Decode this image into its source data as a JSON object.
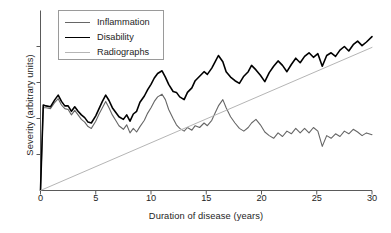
{
  "chart_data": {
    "type": "line",
    "title": "",
    "xlabel": "Duration of disease (years)",
    "ylabel": "Severity (arbitrary units)",
    "xlim": [
      0,
      30
    ],
    "ylim": [
      0,
      10
    ],
    "xticks": [
      0,
      5,
      10,
      15,
      20,
      25,
      30
    ],
    "xtick_labels": [
      "0",
      "5",
      "10",
      "15",
      "20",
      "25",
      "30"
    ],
    "ytick_labels": [],
    "yticks_unlabeled_count": 4,
    "grid": false,
    "legend_position": "upper left",
    "legend_boxed": true,
    "series": [
      {
        "name": "Inflammation",
        "color": "#666666",
        "width": 1.1,
        "x": [
          0,
          0.25,
          0.5,
          0.9,
          1.3,
          1.6,
          1.9,
          2.2,
          2.5,
          2.8,
          3.1,
          3.4,
          3.7,
          4.0,
          4.3,
          4.6,
          5.0,
          5.3,
          5.6,
          5.9,
          6.2,
          6.5,
          6.8,
          7.1,
          7.5,
          7.8,
          8.1,
          8.4,
          8.7,
          9.0,
          9.4,
          9.7,
          10.0,
          10.3,
          10.6,
          11.0,
          11.3,
          11.6,
          12.0,
          12.3,
          12.6,
          13.0,
          13.3,
          13.7,
          14.0,
          14.4,
          14.8,
          15.1,
          15.5,
          15.8,
          16.1,
          16.5,
          16.8,
          17.2,
          17.6,
          18.0,
          18.4,
          18.8,
          19.1,
          19.5,
          19.9,
          20.3,
          20.7,
          21.1,
          21.5,
          21.9,
          22.3,
          22.7,
          23.1,
          23.5,
          23.9,
          24.3,
          24.7,
          25.1,
          25.5,
          25.9,
          26.3,
          26.7,
          27.1,
          27.5,
          27.9,
          28.3,
          28.7,
          29.1,
          29.5,
          30.0
        ],
        "y": [
          0,
          4.6,
          4.6,
          4.55,
          4.9,
          5.1,
          4.75,
          4.55,
          4.5,
          4.2,
          4.45,
          4.2,
          3.95,
          3.8,
          3.55,
          3.45,
          3.85,
          4.25,
          4.6,
          4.95,
          4.6,
          4.2,
          3.9,
          3.6,
          3.4,
          3.65,
          3.2,
          3.45,
          3.25,
          3.55,
          3.9,
          4.3,
          4.6,
          4.95,
          5.2,
          5.35,
          5.05,
          4.5,
          4.0,
          3.65,
          3.45,
          3.3,
          3.5,
          3.35,
          3.6,
          3.5,
          3.75,
          3.6,
          3.9,
          4.3,
          4.7,
          5.05,
          4.6,
          4.1,
          3.75,
          3.45,
          3.3,
          3.5,
          3.75,
          3.95,
          3.65,
          3.25,
          3.05,
          2.9,
          3.2,
          3.0,
          3.3,
          3.15,
          3.45,
          3.2,
          3.45,
          3.2,
          3.5,
          3.3,
          2.45,
          3.05,
          2.9,
          3.15,
          3.0,
          3.3,
          3.15,
          3.4,
          3.25,
          3.05,
          3.2,
          3.1
        ]
      },
      {
        "name": "Disability",
        "color": "#000000",
        "width": 1.6,
        "x": [
          0,
          0.25,
          0.5,
          0.9,
          1.3,
          1.6,
          1.9,
          2.2,
          2.5,
          2.8,
          3.1,
          3.4,
          3.7,
          4.0,
          4.3,
          4.6,
          5.0,
          5.3,
          5.6,
          5.9,
          6.2,
          6.5,
          6.8,
          7.1,
          7.5,
          7.8,
          8.1,
          8.4,
          8.7,
          9.0,
          9.4,
          9.7,
          10.0,
          10.3,
          10.6,
          11.0,
          11.3,
          11.6,
          12.0,
          12.3,
          12.6,
          13.0,
          13.3,
          13.7,
          14.0,
          14.4,
          14.8,
          15.1,
          15.5,
          15.8,
          16.1,
          16.5,
          16.8,
          17.2,
          17.6,
          18.0,
          18.4,
          18.8,
          19.1,
          19.5,
          19.9,
          20.3,
          20.7,
          21.1,
          21.5,
          21.9,
          22.3,
          22.7,
          23.1,
          23.5,
          23.9,
          24.3,
          24.7,
          25.1,
          25.5,
          25.9,
          26.3,
          26.7,
          27.1,
          27.5,
          27.9,
          28.3,
          28.7,
          29.1,
          29.5,
          30.0
        ],
        "y": [
          0,
          4.75,
          4.7,
          4.65,
          5.05,
          5.3,
          4.95,
          4.7,
          4.7,
          4.4,
          4.65,
          4.4,
          4.2,
          4.05,
          3.8,
          3.75,
          4.15,
          4.55,
          4.95,
          5.3,
          5.0,
          4.6,
          4.35,
          4.1,
          3.95,
          4.2,
          3.85,
          4.25,
          4.4,
          4.9,
          5.25,
          5.6,
          5.9,
          6.25,
          6.5,
          6.65,
          6.3,
          5.9,
          5.5,
          5.45,
          5.2,
          5.05,
          5.45,
          5.7,
          6.1,
          6.35,
          6.6,
          6.45,
          6.8,
          7.15,
          7.5,
          7.15,
          6.6,
          6.3,
          6.1,
          5.95,
          6.35,
          6.6,
          6.95,
          6.7,
          6.4,
          6.05,
          6.55,
          6.9,
          7.2,
          6.95,
          6.6,
          7.0,
          7.35,
          7.1,
          7.45,
          7.65,
          7.4,
          7.6,
          6.9,
          7.5,
          7.65,
          7.45,
          7.8,
          8.0,
          7.75,
          8.1,
          8.3,
          8.05,
          8.25,
          8.55
        ]
      },
      {
        "name": "Radiographs",
        "color": "#b5b5b5",
        "width": 1.0,
        "x": [
          0,
          30
        ],
        "y": [
          0,
          7.95
        ]
      }
    ]
  },
  "axes": {
    "xlabel": "Duration of disease (years)",
    "ylabel": "Severity (arbitrary units)",
    "xtick_labels": [
      "0",
      "5",
      "10",
      "15",
      "20",
      "25",
      "30"
    ]
  },
  "legend": {
    "entries": [
      {
        "label": "Inflammation",
        "color": "#666666",
        "width": 1.1
      },
      {
        "label": "Disability",
        "color": "#000000",
        "width": 1.8
      },
      {
        "label": "Radiographs",
        "color": "#b5b5b5",
        "width": 1.0
      }
    ]
  }
}
